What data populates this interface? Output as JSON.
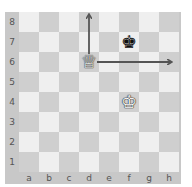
{
  "board": {
    "files": [
      "a",
      "b",
      "c",
      "d",
      "e",
      "f",
      "g",
      "h"
    ],
    "ranks": [
      "8",
      "7",
      "6",
      "5",
      "4",
      "3",
      "2",
      "1"
    ],
    "colors": {
      "light": "#efefef",
      "dark": "#cfcfcf",
      "frame": "#c8c8c8",
      "arrow": "#555555"
    }
  },
  "pieces": [
    {
      "square": "d6",
      "piece": "white-queen",
      "glyph": "♕"
    },
    {
      "square": "f7",
      "piece": "black-king",
      "glyph": "♚"
    },
    {
      "square": "f4",
      "piece": "white-king",
      "glyph": "♔"
    }
  ],
  "arrows": [
    {
      "from": "d6",
      "to": "d8"
    },
    {
      "from": "d6",
      "to": "h6"
    }
  ]
}
